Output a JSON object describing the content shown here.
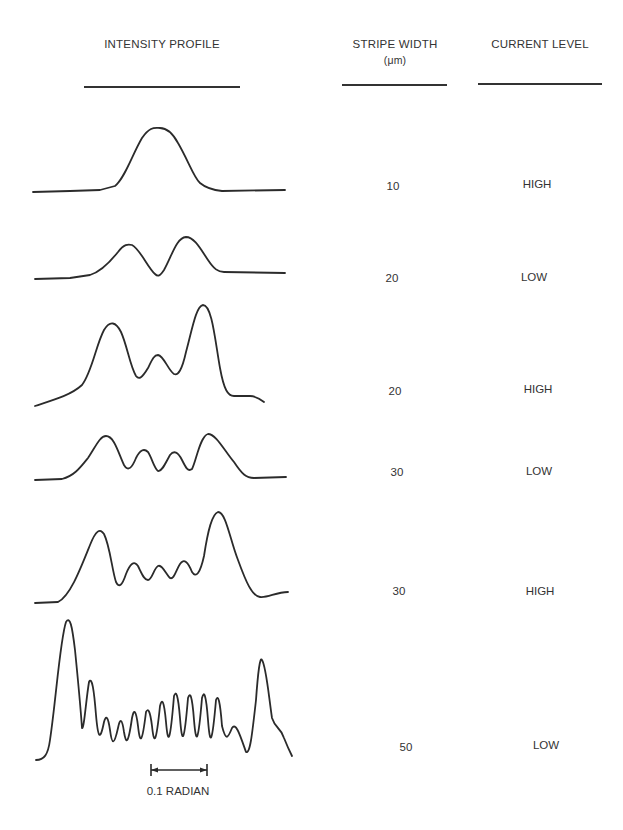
{
  "headers": {
    "intensity_profile": "INTENSITY PROFILE",
    "stripe_width": "STRIPE WIDTH",
    "stripe_width_unit": "(μm)",
    "current_level": "CURRENT LEVEL"
  },
  "rows": [
    {
      "stripe_width": "10",
      "current_level": "HIGH",
      "peaks": 1
    },
    {
      "stripe_width": "20",
      "current_level": "LOW",
      "peaks": 2
    },
    {
      "stripe_width": "20",
      "current_level": "HIGH",
      "peaks": 3
    },
    {
      "stripe_width": "30",
      "current_level": "LOW",
      "peaks": 4
    },
    {
      "stripe_width": "30",
      "current_level": "HIGH",
      "peaks": 5
    },
    {
      "stripe_width": "50",
      "current_level": "LOW",
      "peaks": 13
    }
  ],
  "scale_bar": {
    "label": "0.1 RADIAN"
  },
  "colors": {
    "ink": "#2b2b2b",
    "background": "#ffffff"
  }
}
